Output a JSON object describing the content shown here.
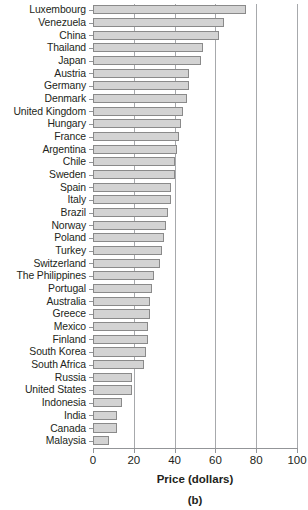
{
  "chart_data": {
    "type": "bar",
    "orientation": "horizontal",
    "title": "",
    "xlabel": "Price (dollars)",
    "ylabel": "",
    "xlim": [
      0,
      100
    ],
    "xticks": [
      0,
      20,
      40,
      60,
      80,
      100
    ],
    "grid": true,
    "grid_axis": "x",
    "legend": null,
    "caption": "(b)",
    "bar_color": "#d3d3d3",
    "bar_edge_color": "#8a8a8a",
    "axis_color": "#939598",
    "categories": [
      "Luxembourg",
      "Venezuela",
      "China",
      "Thailand",
      "Japan",
      "Austria",
      "Germany",
      "Denmark",
      "United Kingdom",
      "Hungary",
      "France",
      "Argentina",
      "Chile",
      "Sweden",
      "Spain",
      "Italy",
      "Brazil",
      "Norway",
      "Poland",
      "Turkey",
      "Switzerland",
      "The Philippines",
      "Portugal",
      "Australia",
      "Greece",
      "Mexico",
      "Finland",
      "South Korea",
      "South Africa",
      "Russia",
      "United States",
      "Indonesia",
      "India",
      "Canada",
      "Malaysia"
    ],
    "values": [
      75,
      64,
      62,
      54,
      53,
      47,
      47,
      46,
      44,
      43,
      42,
      41,
      40,
      40,
      38,
      38,
      37,
      36,
      35,
      34,
      33,
      30,
      29,
      28,
      28,
      27,
      27,
      26,
      25,
      19,
      19,
      14,
      12,
      12,
      8
    ]
  }
}
